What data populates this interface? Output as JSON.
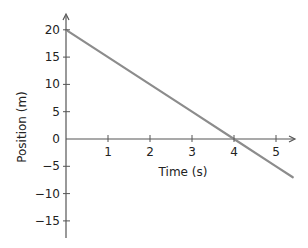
{
  "chart_data": {
    "type": "line",
    "title": "",
    "xlabel": "Time (s)",
    "ylabel": "Position (m)",
    "xlim": [
      0,
      5.4
    ],
    "ylim": [
      -18,
      21
    ],
    "x_ticks": [
      1,
      2,
      3,
      4,
      5
    ],
    "x_tick_labels": [
      "1",
      "2",
      "3",
      "4",
      "5"
    ],
    "y_ticks": [
      20,
      15,
      10,
      5,
      0,
      -5,
      -10,
      -15
    ],
    "y_tick_labels": [
      "20",
      "15",
      "10",
      "5",
      "0",
      "−5",
      "−10",
      "−15"
    ],
    "grid": false,
    "legend": null,
    "series": [
      {
        "name": "position",
        "x": [
          0,
          1,
          2,
          3,
          4,
          5,
          5.4
        ],
        "y": [
          20,
          15,
          10,
          5,
          0,
          -5,
          -7
        ],
        "color": "#8c8c8c"
      }
    ]
  },
  "colors": {
    "axis": "#555555",
    "line": "#8c8c8c",
    "text": "#222222"
  }
}
